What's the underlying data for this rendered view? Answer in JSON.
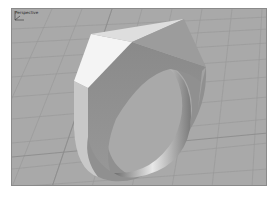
{
  "viewport": {
    "label": "Perspective",
    "background_color": "#a9a9a9",
    "grid_color": "#9a9a9a",
    "grid_major_color": "#8c8c8c"
  },
  "model": {
    "name": "faceted-signet-ring",
    "colors": {
      "top_left_face": "#f4f4f4",
      "top_right_face": "#d2d2d2",
      "left_side_face": "#dcdcdc",
      "front_face": "#8e8e8e",
      "right_face": "#9a9a9a",
      "band_outer": "#909090",
      "band_inner_light": "#e6e6e6",
      "band_inner_dark": "#6e6e6e"
    }
  },
  "axis_widget": {
    "x_label": "x",
    "y_label": "y",
    "z_label": "z"
  }
}
